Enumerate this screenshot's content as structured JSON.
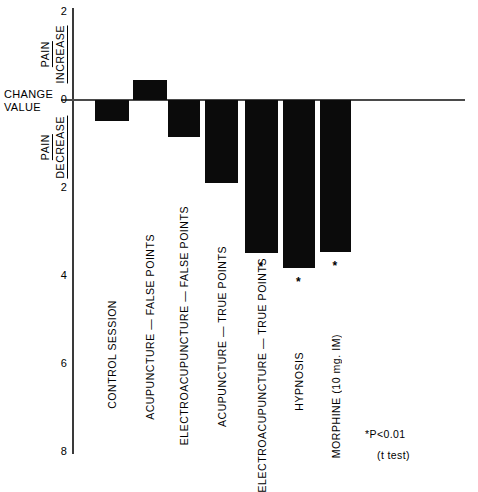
{
  "chart_data": {
    "type": "bar",
    "title": "",
    "subtitle": "",
    "xlabel": "",
    "ylabel": "CHANGE VALUE",
    "orientation": "vertical",
    "grid": false,
    "legend": "none",
    "y_axis": {
      "label_lines": [
        "CHANGE",
        "VALUE"
      ],
      "ticks": [
        "2",
        "0",
        "2",
        "4",
        "6",
        "8"
      ],
      "tick_values": [
        -2,
        0,
        2,
        4,
        6,
        8
      ],
      "ylim": [
        8,
        -2
      ],
      "direction_note": "values below zero denote pain decrease; above zero denote pain increase",
      "upper_region": {
        "term_top": "PAIN",
        "term_bottom": "INCREASE"
      },
      "lower_region": {
        "term_top": "PAIN",
        "term_bottom": "DECREASE"
      }
    },
    "categories": [
      "CONTROL SESSION",
      "ACUPUNCTURE — FALSE POINTS",
      "ELECTROACUPUNCTURE — FALSE POINTS",
      "ACUPUNCTURE — TRUE POINTS",
      "ELECTROACUPUNCTURE — TRUE POINTS",
      "HYPNOSIS",
      "MORPHINE  (10 mg.  IM)"
    ],
    "values": [
      -0.48,
      0.45,
      -0.85,
      -1.88,
      -3.47,
      -3.82,
      -3.45
    ],
    "significance": [
      false,
      false,
      false,
      false,
      true,
      true,
      true
    ],
    "significance_marker": "*",
    "annotations": {
      "p_value": "*P<0.01",
      "test": "(t test)"
    },
    "colors": {
      "bar": "#0b0b0b",
      "axis": "#3a3a3a",
      "zero_line": "#4a4a4a",
      "background": "#ffffff",
      "text": "#000000"
    }
  }
}
